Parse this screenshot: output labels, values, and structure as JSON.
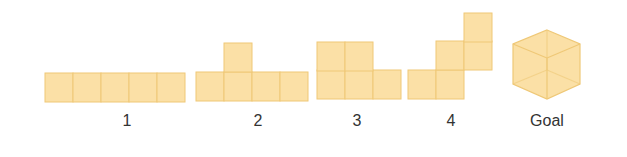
{
  "colors": {
    "fill": "#FBE0A6",
    "stroke": "#EFC877"
  },
  "shapes": [
    {
      "label": "1",
      "cells": [
        [
          45,
          73
        ],
        [
          73,
          73
        ],
        [
          101,
          73
        ],
        [
          129,
          73
        ],
        [
          157,
          73
        ]
      ]
    },
    {
      "label": "2",
      "cells": [
        [
          196,
          72
        ],
        [
          224,
          72
        ],
        [
          252,
          72
        ],
        [
          280,
          72
        ],
        [
          224,
          43
        ]
      ]
    },
    {
      "label": "3",
      "cells": [
        [
          317,
          70
        ],
        [
          345,
          70
        ],
        [
          373,
          70
        ],
        [
          317,
          42
        ],
        [
          345,
          42
        ]
      ]
    },
    {
      "label": "4",
      "cells": [
        [
          408,
          70
        ],
        [
          436,
          70
        ],
        [
          436,
          41
        ],
        [
          464,
          41
        ],
        [
          464,
          13
        ]
      ]
    }
  ],
  "goal": {
    "label": "Goal"
  },
  "labels": [
    {
      "text": "1",
      "x": 127
    },
    {
      "text": "2",
      "x": 258
    },
    {
      "text": "3",
      "x": 357
    },
    {
      "text": "4",
      "x": 451
    },
    {
      "text": "Goal",
      "x": 547
    }
  ]
}
